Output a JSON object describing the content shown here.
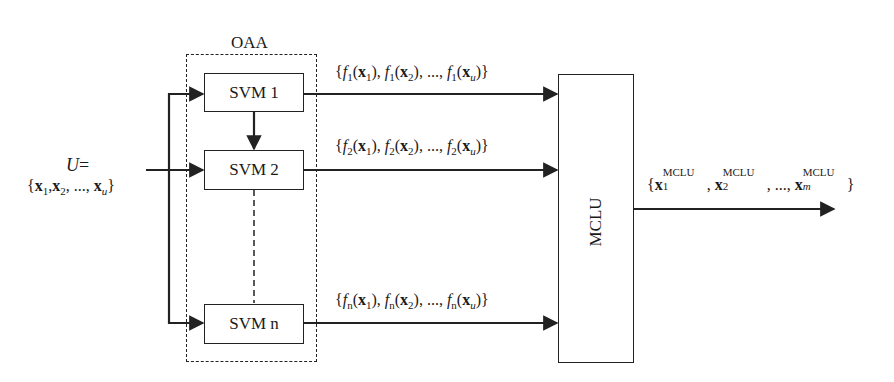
{
  "diagram": {
    "group_label": "OAA",
    "input": {
      "line1": {
        "symbol": "U",
        "eq": "="
      },
      "set": {
        "open": "{",
        "x": "x",
        "sub1": "1",
        "sub2": "2",
        "subu": "u",
        "ellipsis": "...",
        "close": "}",
        "comma": ","
      }
    },
    "classifiers": [
      {
        "label": "SVM 1"
      },
      {
        "label": "SVM 2"
      },
      {
        "label": "SVM n"
      }
    ],
    "outputs": [
      {
        "f": "f",
        "idx": "1",
        "x": "x",
        "s1": "1",
        "s2": "2",
        "su": "u",
        "ellipsis": "..."
      },
      {
        "f": "f",
        "idx": "2",
        "x": "x",
        "s1": "1",
        "s2": "2",
        "su": "u",
        "ellipsis": "..."
      },
      {
        "f": "f",
        "idx": "n",
        "x": "x",
        "s1": "1",
        "s2": "2",
        "su": "u",
        "ellipsis": "..."
      }
    ],
    "aggregator": {
      "label": "MCLU"
    },
    "result": {
      "x": "x",
      "sup": "MCLU",
      "s1": "1",
      "s2": "2",
      "sm": "m",
      "ellipsis": "..."
    },
    "colors": {
      "stroke": "#222222",
      "background": "#ffffff"
    }
  }
}
